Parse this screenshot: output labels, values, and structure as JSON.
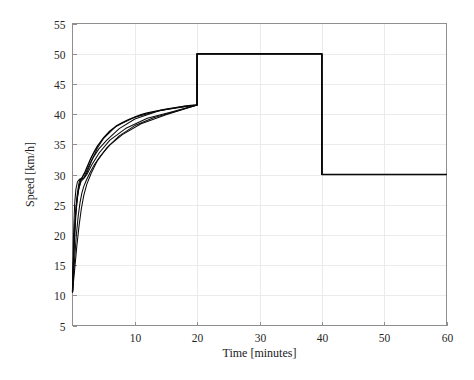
{
  "chart_data": {
    "type": "line",
    "title": "",
    "xlabel": "Time [minutes]",
    "ylabel": "Speed [km/h]",
    "xlim": [
      0,
      60
    ],
    "ylim": [
      5,
      55
    ],
    "xticks": [
      10,
      20,
      30,
      40,
      50,
      60
    ],
    "ytick_labels": [
      "5",
      "10",
      "15",
      "20",
      "25",
      "30",
      "35",
      "40",
      "45",
      "50",
      "55"
    ],
    "xtick_labels": [
      "10",
      "20",
      "30",
      "40",
      "50",
      "60"
    ],
    "yticks": [
      5,
      10,
      15,
      20,
      25,
      30,
      35,
      40,
      45,
      50,
      55
    ],
    "grid": true,
    "legend": "none",
    "line_color": "#000000",
    "grid_color": "#e9e9e9",
    "frame_color": "#8f8f8f",
    "annotations": [
      "Rapid exponential rise from ~10.5 km/h toward ~41.5 km/h over first 20 minutes",
      "Step up to 50 km/h at t = 20 minutes",
      "Step down to 30 km/h at t = 40 minutes",
      "Dense bundle of near-identical trajectories during initial transient"
    ],
    "series": [
      {
        "name": "speed-trajectory",
        "x": [
          0,
          0.2,
          0.4,
          0.6,
          0.8,
          1,
          1.3,
          1.6,
          2,
          2.5,
          3,
          3.5,
          4,
          5,
          6,
          7,
          8,
          9,
          10,
          11,
          12,
          13,
          14,
          15,
          16,
          17,
          18,
          19,
          19.99,
          20,
          30,
          39.99,
          40,
          50,
          60
        ],
        "y": [
          10.5,
          16.8,
          21.4,
          24.4,
          26.4,
          27.7,
          29.0,
          29.6,
          30.4,
          31.6,
          32.8,
          33.8,
          34.7,
          36.1,
          37.2,
          38.0,
          38.6,
          39.1,
          39.5,
          39.9,
          40.2,
          40.4,
          40.6,
          40.8,
          41.0,
          41.15,
          41.3,
          41.45,
          41.5,
          50,
          50,
          50,
          30,
          30,
          30
        ]
      },
      {
        "name": "speed-trajectory-variant-a",
        "x": [
          0,
          0.25,
          0.5,
          0.75,
          1,
          1.25,
          1.5,
          1.75,
          2,
          2.5,
          3,
          4,
          5,
          7,
          10,
          14,
          18,
          19.99,
          20,
          39.99,
          40,
          60
        ],
        "y": [
          10.5,
          18.5,
          23.6,
          26.6,
          28.4,
          29.3,
          29.4,
          29.3,
          29.6,
          30.8,
          32.1,
          34.4,
          36.0,
          38.0,
          39.5,
          40.6,
          41.3,
          41.5,
          50,
          50,
          30,
          30
        ]
      },
      {
        "name": "speed-trajectory-variant-b",
        "x": [
          0,
          0.3,
          0.6,
          0.9,
          1.2,
          1.5,
          1.8,
          2.2,
          2.8,
          3.5,
          4.5,
          6,
          8,
          11,
          15,
          19.99,
          20,
          39.99,
          40,
          60
        ],
        "y": [
          10.5,
          15.4,
          19.8,
          23.0,
          25.3,
          26.9,
          28.0,
          29.0,
          30.3,
          31.6,
          33.1,
          34.9,
          36.6,
          38.4,
          39.9,
          41.5,
          50,
          50,
          30,
          30
        ]
      },
      {
        "name": "speed-trajectory-variant-c",
        "x": [
          0,
          0.15,
          0.35,
          0.55,
          0.8,
          1.1,
          1.4,
          1.8,
          2.4,
          3.2,
          4.2,
          5.5,
          7.5,
          10,
          14,
          19.99,
          20,
          39.99,
          40,
          60
        ],
        "y": [
          10.5,
          19.6,
          25.2,
          27.6,
          28.8,
          29.2,
          29.1,
          29.4,
          30.9,
          32.6,
          34.2,
          35.7,
          37.6,
          39.2,
          40.6,
          41.5,
          50,
          50,
          30,
          30
        ]
      },
      {
        "name": "speed-trajectory-variant-d",
        "x": [
          0,
          0.35,
          0.7,
          1.05,
          1.4,
          1.8,
          2.3,
          3,
          4,
          5.5,
          7.5,
          10,
          13,
          17,
          19.99,
          20,
          39.99,
          40,
          60
        ],
        "y": [
          10.5,
          14.3,
          18.2,
          21.5,
          24.2,
          26.5,
          28.4,
          30.2,
          32.3,
          34.4,
          36.4,
          38.1,
          39.4,
          40.6,
          41.5,
          50,
          50,
          30,
          30
        ]
      },
      {
        "name": "speed-trajectory-variant-e",
        "x": [
          0,
          0.2,
          0.45,
          0.7,
          1,
          1.35,
          1.75,
          2.3,
          3.1,
          4.3,
          6,
          8.5,
          12,
          16,
          19.99,
          20,
          39.99,
          40,
          60
        ],
        "y": [
          10.5,
          17.7,
          22.8,
          25.6,
          27.6,
          28.8,
          29.3,
          30.0,
          31.6,
          33.6,
          35.7,
          37.6,
          39.3,
          40.4,
          41.5,
          50,
          50,
          30,
          30
        ]
      }
    ]
  }
}
